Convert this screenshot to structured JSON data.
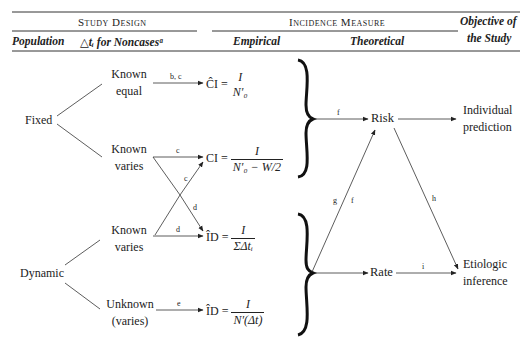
{
  "header": {
    "study_design": "Study Design",
    "incidence_measure": "Incidence Measure",
    "objective": "Objective of",
    "objective2": "the Study",
    "population": "Population",
    "delta_t": "△tᵢ for Noncasesᵃ",
    "empirical": "Empirical",
    "theoretical": "Theoretical"
  },
  "populations": {
    "fixed": "Fixed",
    "dynamic": "Dynamic"
  },
  "branches": [
    {
      "line1": "Known",
      "line2": "equal"
    },
    {
      "line1": "Known",
      "line2": "varies"
    },
    {
      "line1": "Known",
      "line2": "varies"
    },
    {
      "line1": "Unknown",
      "line2": "(varies)"
    }
  ],
  "arrow_labels": {
    "a1": "b, c",
    "a2": "c",
    "a3_cross": "c",
    "a4_cross": "d",
    "a5": "d",
    "a6": "e",
    "f_top": "f",
    "g": "g",
    "f_diag": "f",
    "h": "h",
    "i": "i"
  },
  "formulas": [
    {
      "lhs": "ĈI =",
      "num": "I",
      "den": "N′₀"
    },
    {
      "lhs": "CI =",
      "num": "I",
      "den": "N′₀ − W/2"
    },
    {
      "lhs": "ÎD =",
      "num": "I",
      "den": "ΣΔtᵢ"
    },
    {
      "lhs": "ÎD =",
      "num": "I",
      "den": "N′(Δt)"
    }
  ],
  "measures": {
    "risk": "Risk",
    "rate": "Rate"
  },
  "objectives": {
    "individual": [
      "Individual",
      "prediction"
    ],
    "etiologic": [
      "Etiologic",
      "inference"
    ]
  }
}
